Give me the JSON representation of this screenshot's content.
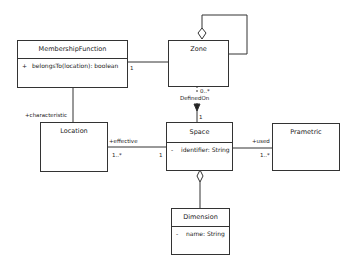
{
  "diagram": {
    "type": "uml-class-diagram",
    "classes": [
      {
        "id": "membership",
        "name": "MembershipFunction",
        "members": [
          {
            "visibility": "+",
            "text": "belongsTo(location): boolean"
          }
        ]
      },
      {
        "id": "zone",
        "name": "Zone",
        "members": []
      },
      {
        "id": "location",
        "name": "Location",
        "members": []
      },
      {
        "id": "space",
        "name": "Space",
        "members": [
          {
            "visibility": "-",
            "text": "identifier: String"
          }
        ]
      },
      {
        "id": "prametric",
        "name": "Prametric",
        "members": []
      },
      {
        "id": "dimension",
        "name": "Dimension",
        "members": [
          {
            "visibility": "-",
            "text": "name: String"
          }
        ]
      }
    ],
    "relations": [
      {
        "from": "zone",
        "to": "zone",
        "kind": "aggregation",
        "label": ""
      },
      {
        "from": "membership",
        "to": "zone",
        "kind": "association",
        "target_multiplicity": "1"
      },
      {
        "from": "membership",
        "to": "location",
        "kind": "association",
        "role": "+characteristic"
      },
      {
        "from": "zone",
        "to": "space",
        "kind": "directed-association",
        "label": "DefinedOn",
        "source_multiplicity": "0..*",
        "target_multiplicity": "1"
      },
      {
        "from": "location",
        "to": "space",
        "kind": "association",
        "role": "+effective",
        "source_multiplicity": "1..*",
        "target_multiplicity": "1"
      },
      {
        "from": "space",
        "to": "prametric",
        "kind": "association",
        "role": "+used",
        "target_multiplicity": "1..*"
      },
      {
        "from": "space",
        "to": "dimension",
        "kind": "aggregation",
        "label": ""
      }
    ],
    "labels": {
      "membership_zone_mult": "1",
      "characteristic_role": "+characteristic",
      "zone_space_mult_top": "0..*",
      "zone_space_name": "DefinedOn",
      "zone_space_mult_bottom": "1",
      "effective_role": "+effective",
      "effective_mult_location": "1..*",
      "effective_mult_space": "1",
      "used_role": "+used",
      "used_mult": "1..*"
    }
  }
}
